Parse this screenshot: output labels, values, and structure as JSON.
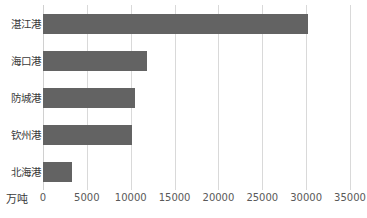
{
  "chart_data": {
    "type": "bar",
    "orientation": "horizontal",
    "title": "",
    "xlabel": "",
    "ylabel": "",
    "unit_label": "万吨",
    "categories": [
      "湛江港",
      "海口港",
      "防城港",
      "钦州港",
      "北海港"
    ],
    "values": [
      30200,
      11800,
      10500,
      10100,
      3300
    ],
    "series": [
      {
        "name": "",
        "values": [
          30200,
          11800,
          10500,
          10100,
          3300
        ]
      }
    ],
    "xlim": [
      0,
      35000
    ],
    "xticks": [
      0,
      5000,
      10000,
      15000,
      20000,
      25000,
      30000,
      35000
    ],
    "xtick_labels": [
      "0",
      "5000",
      "10000",
      "15000",
      "20000",
      "25000",
      "30000",
      "35000"
    ],
    "grid": true,
    "grid_axis": "x",
    "legend": false,
    "legend_position": "none",
    "colors": {
      "bar": "#636363",
      "gridline": "#d9d9d9",
      "axis": "#d0d0d0",
      "category_text": "#3a3a3a",
      "tick_text": "#595959",
      "background": "#ffffff"
    }
  }
}
